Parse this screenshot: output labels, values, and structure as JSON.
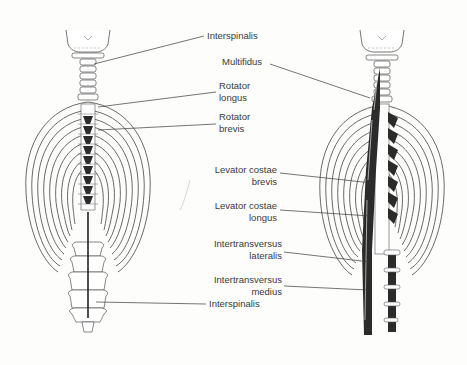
{
  "figure": {
    "left_view": {
      "name": "Deep back muscles - left view",
      "labels": [
        {
          "id": "interspinalis_top",
          "text": "Interspinalis"
        },
        {
          "id": "rotator_longus",
          "lines": [
            "Rotator",
            "longus"
          ]
        },
        {
          "id": "rotator_brevis",
          "lines": [
            "Rotator",
            "brevis"
          ]
        },
        {
          "id": "interspinalis_bottom",
          "text": "Interspinalis"
        }
      ]
    },
    "right_view": {
      "name": "Deep back muscles - right view",
      "labels": [
        {
          "id": "multifidus",
          "text": "Multifidus"
        },
        {
          "id": "levator_costae_brevis",
          "lines": [
            "Levator costae",
            "brevis"
          ]
        },
        {
          "id": "levator_costae_longus",
          "lines": [
            "Levator costae",
            "longus"
          ]
        },
        {
          "id": "intertransversus_lateralis",
          "lines": [
            "Intertransversus",
            "lateralis"
          ]
        },
        {
          "id": "intertransversus_medius",
          "lines": [
            "Intertransversus",
            "medius"
          ]
        }
      ]
    },
    "colors": {
      "line": "#3a3a3a",
      "muscle": "#2b2b2b",
      "background": "#fdfdfc"
    }
  }
}
